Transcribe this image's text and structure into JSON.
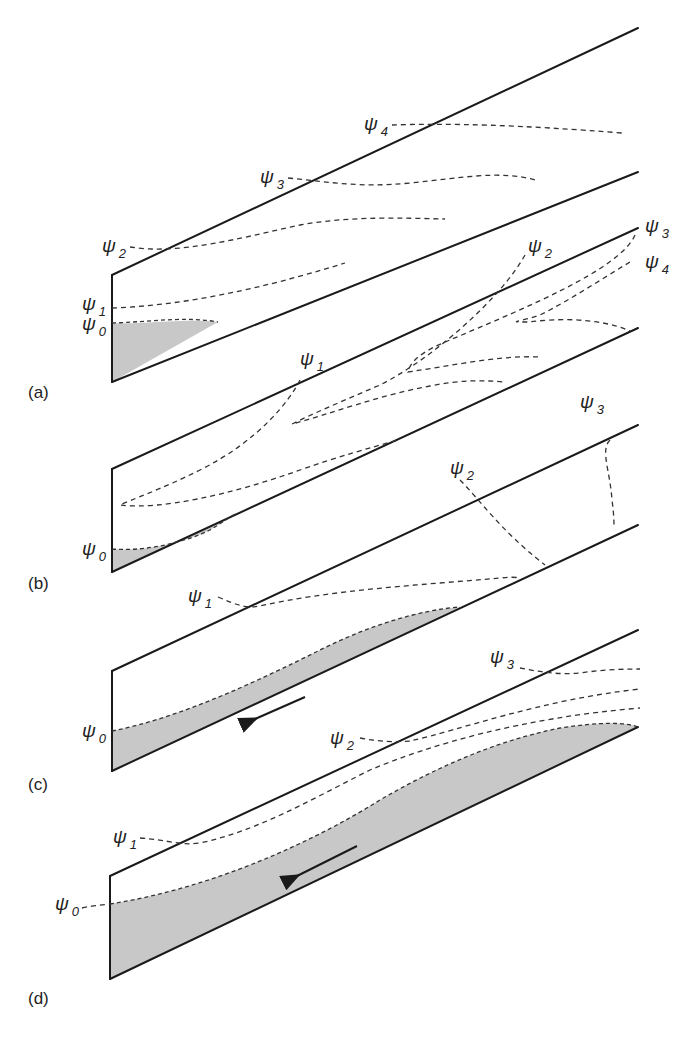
{
  "figure": {
    "symbol": "ψ",
    "panels": [
      {
        "id": "a",
        "label": "(a)",
        "streamlines": [
          "0",
          "1",
          "2",
          "3",
          "4"
        ]
      },
      {
        "id": "b",
        "label": "(b)",
        "streamlines": [
          "0",
          "1",
          "2",
          "3",
          "4"
        ]
      },
      {
        "id": "c",
        "label": "(c)",
        "streamlines": [
          "0",
          "1",
          "2",
          "3"
        ]
      },
      {
        "id": "d",
        "label": "(d)",
        "streamlines": [
          "0",
          "1",
          "2",
          "3"
        ]
      }
    ],
    "colors": {
      "wall": "#1a1a1a",
      "streamline": "#333333",
      "shaded_layer": "#c8c8c8",
      "background": "#ffffff"
    }
  }
}
